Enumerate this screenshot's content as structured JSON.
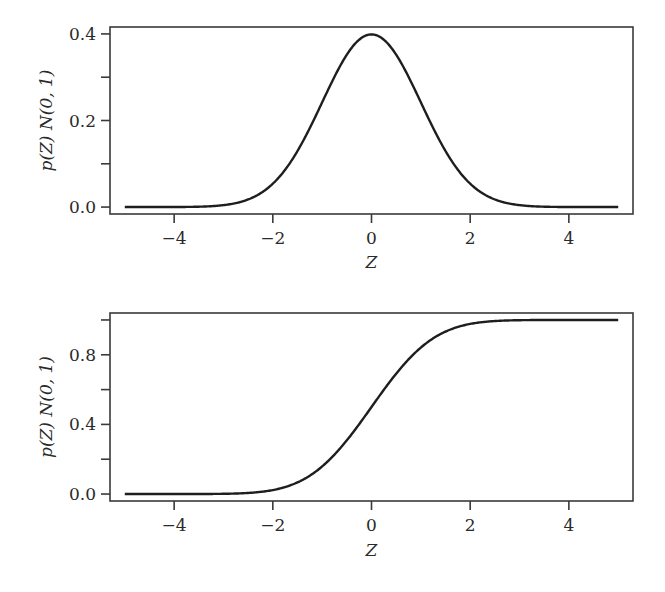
{
  "chart_data": [
    {
      "type": "line",
      "title": "",
      "xlabel": "Z",
      "ylabel": "p(Z) N(0, 1)",
      "xlim": [
        -5.3,
        5.3
      ],
      "ylim": [
        -0.016,
        0.416
      ],
      "xticks": [
        -4,
        -2,
        0,
        2,
        4
      ],
      "xtick_labels": [
        "−4",
        "−2",
        "0",
        "2",
        "4"
      ],
      "yticks": [
        0.0,
        0.1,
        0.2,
        0.3,
        0.4
      ],
      "ytick_labels": [
        "0.0",
        "",
        "0.2",
        "",
        "0.4"
      ],
      "grid": false,
      "legend": null,
      "series": [
        {
          "name": "Standard normal PDF",
          "x": [
            -5,
            -4,
            -3,
            -2.5,
            -2,
            -1.5,
            -1,
            -0.5,
            0,
            0.5,
            1,
            1.5,
            2,
            2.5,
            3,
            4,
            5
          ],
          "y": [
            0.0,
            0.0001,
            0.0044,
            0.0175,
            0.054,
            0.1295,
            0.242,
            0.3521,
            0.3989,
            0.3521,
            0.242,
            0.1295,
            0.054,
            0.0175,
            0.0044,
            0.0001,
            0.0
          ]
        }
      ]
    },
    {
      "type": "line",
      "title": "",
      "xlabel": "Z",
      "ylabel": "p(Z) N(0, 1)",
      "xlim": [
        -5.3,
        5.3
      ],
      "ylim": [
        -0.04,
        1.04
      ],
      "xticks": [
        -4,
        -2,
        0,
        2,
        4
      ],
      "xtick_labels": [
        "−4",
        "−2",
        "0",
        "2",
        "4"
      ],
      "yticks": [
        0.0,
        0.2,
        0.4,
        0.6,
        0.8,
        1.0
      ],
      "ytick_labels": [
        "0.0",
        "",
        "0.4",
        "",
        "0.8",
        ""
      ],
      "grid": false,
      "legend": null,
      "series": [
        {
          "name": "Standard normal CDF",
          "x": [
            -5,
            -4,
            -3,
            -2.5,
            -2,
            -1.5,
            -1,
            -0.5,
            0,
            0.5,
            1,
            1.5,
            2,
            2.5,
            3,
            4,
            5
          ],
          "y": [
            0.0,
            0.0,
            0.0013,
            0.0062,
            0.0228,
            0.0668,
            0.1587,
            0.3085,
            0.5,
            0.6915,
            0.8413,
            0.9332,
            0.9772,
            0.9938,
            0.9987,
            1.0,
            1.0
          ]
        }
      ]
    }
  ]
}
